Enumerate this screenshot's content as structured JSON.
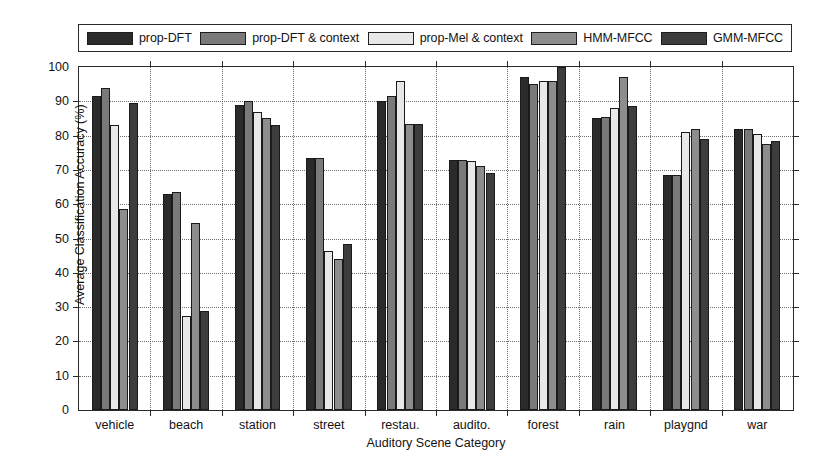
{
  "chart_data": {
    "type": "bar",
    "title": "",
    "xlabel": "Auditory Scene Category",
    "ylabel": "Average Classification Accuracy (%)",
    "ylim": [
      0,
      100
    ],
    "yticks": [
      0,
      10,
      20,
      30,
      40,
      50,
      60,
      70,
      80,
      90,
      100
    ],
    "grid": true,
    "legend_position": "top",
    "categories": [
      "vehicle",
      "beach",
      "station",
      "street",
      "restau.",
      "audito.",
      "forest",
      "rain",
      "playgnd",
      "war"
    ],
    "series": [
      {
        "name": "prop-DFT",
        "color": "#2b2b2b",
        "values": [
          91.5,
          63.0,
          89.0,
          73.5,
          90.0,
          73.0,
          97.0,
          85.0,
          68.5,
          82.0
        ]
      },
      {
        "name": "prop-DFT & context",
        "color": "#7a7a7a",
        "values": [
          94.0,
          63.5,
          90.0,
          73.5,
          91.5,
          73.0,
          95.0,
          85.5,
          68.5,
          82.0
        ]
      },
      {
        "name": "prop-Mel & context",
        "color": "#e8e8e8",
        "values": [
          83.0,
          27.5,
          87.0,
          46.5,
          96.0,
          72.5,
          96.0,
          88.0,
          81.0,
          80.5
        ]
      },
      {
        "name": "HMM-MFCC",
        "color": "#8d8d8d",
        "values": [
          58.5,
          54.5,
          85.0,
          44.0,
          83.5,
          71.0,
          96.0,
          97.0,
          82.0,
          77.5
        ]
      },
      {
        "name": "GMM-MFCC",
        "color": "#3d3d3d",
        "values": [
          89.5,
          29.0,
          83.0,
          48.5,
          83.5,
          69.0,
          100.0,
          88.5,
          79.0,
          78.5
        ]
      }
    ]
  },
  "legend": {
    "entries": [
      {
        "label": "prop-DFT",
        "swatch": "legend-swatch-prop-dft"
      },
      {
        "label": "prop-DFT & context",
        "swatch": "legend-swatch-prop-dft-context"
      },
      {
        "label": "prop-Mel & context",
        "swatch": "legend-swatch-prop-mel-context"
      },
      {
        "label": "HMM-MFCC",
        "swatch": "legend-swatch-hmm-mfcc"
      },
      {
        "label": "GMM-MFCC",
        "swatch": "legend-swatch-gmm-mfcc"
      }
    ]
  },
  "axes": {
    "y_title": "Average Classification Accuracy (%)",
    "x_title": "Auditory Scene Category",
    "y_tick_labels": [
      "0",
      "10",
      "20",
      "30",
      "40",
      "50",
      "60",
      "70",
      "80",
      "90",
      "100"
    ],
    "x_tick_labels": [
      "vehicle",
      "beach",
      "station",
      "street",
      "restau.",
      "audito.",
      "forest",
      "rain",
      "playgnd",
      "war"
    ]
  }
}
